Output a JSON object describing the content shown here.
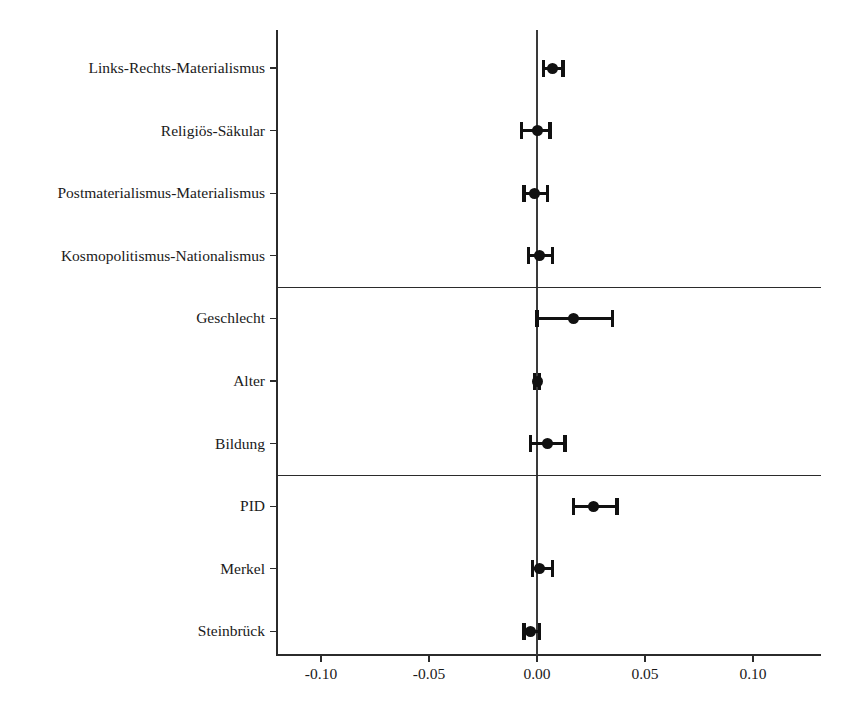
{
  "chart_data": {
    "type": "scatter",
    "subtype": "coefficient-plot-with-error-bars",
    "title": "",
    "subtitle": "",
    "xlabel": "",
    "ylabel": "",
    "xlim": [
      -0.13,
      0.13
    ],
    "xticks": [
      -0.1,
      -0.05,
      0.0,
      0.05,
      0.1
    ],
    "xtick_labels": [
      "-0.10",
      "-0.05",
      "0.00",
      "0.05",
      "0.10"
    ],
    "grid": false,
    "legend": null,
    "zero_reference_line": 0.0,
    "group_separators_after": [
      "Kosmopolitismus-Nationalismus",
      "Bildung"
    ],
    "categories": [
      "Links-Rechts-Materialismus",
      "Religiös-Säkular",
      "Postmaterialismus-Materialismus",
      "Kosmopolitismus-Nationalismus",
      "Geschlecht",
      "Alter",
      "Bildung",
      "PID",
      "Merkel",
      "Steinbrück"
    ],
    "points": [
      {
        "label": "Links-Rechts-Materialismus",
        "estimate": 0.007,
        "ci_low": 0.003,
        "ci_high": 0.012
      },
      {
        "label": "Religiös-Säkular",
        "estimate": 0.0,
        "ci_low": -0.007,
        "ci_high": 0.006
      },
      {
        "label": "Postmaterialismus-Materialismus",
        "estimate": -0.001,
        "ci_low": -0.006,
        "ci_high": 0.005
      },
      {
        "label": "Kosmopolitismus-Nationalismus",
        "estimate": 0.001,
        "ci_low": -0.004,
        "ci_high": 0.007
      },
      {
        "label": "Geschlecht",
        "estimate": 0.017,
        "ci_low": 0.0,
        "ci_high": 0.035
      },
      {
        "label": "Alter",
        "estimate": 0.0,
        "ci_low": -0.001,
        "ci_high": 0.001
      },
      {
        "label": "Bildung",
        "estimate": 0.005,
        "ci_low": -0.003,
        "ci_high": 0.013
      },
      {
        "label": "PID",
        "estimate": 0.026,
        "ci_low": 0.017,
        "ci_high": 0.037
      },
      {
        "label": "Merkel",
        "estimate": 0.001,
        "ci_low": -0.002,
        "ci_high": 0.007
      },
      {
        "label": "Steinbrück",
        "estimate": -0.003,
        "ci_low": -0.006,
        "ci_high": 0.001
      }
    ],
    "colors": {
      "point": "#111111",
      "error_bar": "#111111",
      "axis": "#2b2b2b",
      "zero_line": "#3a3a3a",
      "background": "#ffffff"
    }
  }
}
